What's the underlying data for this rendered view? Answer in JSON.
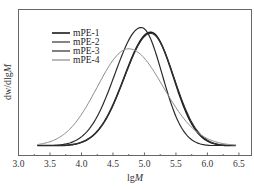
{
  "chart_data": {
    "type": "line",
    "title": "",
    "xlabel": "lgM",
    "ylabel": "dw/dlgM",
    "xlim": [
      3.0,
      6.7
    ],
    "ylim": [
      0,
      1.12
    ],
    "xticks": [
      3.0,
      3.5,
      4.0,
      4.5,
      5.0,
      5.5,
      6.0,
      6.5
    ],
    "xtick_labels": [
      "3.0",
      "3.5",
      "4.0",
      "4.5",
      "5.0",
      "5.5",
      "6.0",
      "6.5"
    ],
    "yticks": [],
    "grid": false,
    "legend_position": "upper left",
    "series": [
      {
        "name": "mPE-1",
        "color": "#1a1a1a",
        "width": 1.6,
        "peak_x": 5.1,
        "peak_y": 0.96,
        "sigma_left": 0.42,
        "sigma_right": 0.36,
        "x": [
          3.3,
          3.5,
          4.0,
          4.5,
          4.8,
          5.0,
          5.1,
          5.3,
          5.5,
          5.8,
          6.0,
          6.45
        ],
        "y": [
          0.0,
          0.01,
          0.08,
          0.38,
          0.72,
          0.9,
          0.96,
          0.82,
          0.55,
          0.18,
          0.06,
          0.0
        ]
      },
      {
        "name": "mPE-2",
        "color": "#333333",
        "width": 1.1,
        "peak_x": 5.1,
        "peak_y": 0.95,
        "sigma_left": 0.42,
        "sigma_right": 0.37,
        "x": [
          3.3,
          3.5,
          4.0,
          4.5,
          4.8,
          5.0,
          5.1,
          5.3,
          5.5,
          5.8,
          6.0,
          6.45
        ],
        "y": [
          0.0,
          0.01,
          0.08,
          0.37,
          0.71,
          0.89,
          0.95,
          0.82,
          0.56,
          0.19,
          0.07,
          0.0
        ]
      },
      {
        "name": "mPE-3",
        "color": "#2a2a2a",
        "width": 1.2,
        "peak_x": 4.95,
        "peak_y": 1.0,
        "sigma_left": 0.42,
        "sigma_right": 0.33,
        "x": [
          3.3,
          3.5,
          4.0,
          4.5,
          4.8,
          4.95,
          5.2,
          5.5,
          5.8,
          6.0,
          6.45
        ],
        "y": [
          0.0,
          0.02,
          0.13,
          0.52,
          0.9,
          1.0,
          0.8,
          0.38,
          0.1,
          0.03,
          0.0
        ]
      },
      {
        "name": "mPE-4",
        "color": "#8a8a8a",
        "width": 1.0,
        "peak_x": 4.75,
        "peak_y": 0.82,
        "sigma_left": 0.5,
        "sigma_right": 0.55,
        "x": [
          3.3,
          3.5,
          4.0,
          4.5,
          4.75,
          5.0,
          5.5,
          6.0,
          6.45
        ],
        "y": [
          0.0,
          0.04,
          0.28,
          0.72,
          0.82,
          0.74,
          0.36,
          0.06,
          0.0
        ]
      }
    ]
  }
}
